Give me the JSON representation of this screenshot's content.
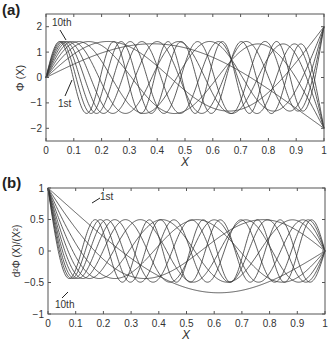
{
  "chart_data": [
    {
      "panel": "(a)",
      "type": "line",
      "title": "",
      "xlabel": "X",
      "ylabel": "Φ (X)",
      "xlim": [
        0,
        1
      ],
      "ylim": [
        -2.5,
        2.5
      ],
      "xticks": [
        "0",
        "0.1",
        "0.2",
        "0.3",
        "0.4",
        "0.5",
        "0.6",
        "0.7",
        "0.8",
        "0.9",
        "1"
      ],
      "yticks": [
        "-2",
        "-1",
        "0",
        "1",
        "2"
      ],
      "grid": false,
      "series_count": 10,
      "modes": [
        1,
        2,
        3,
        4,
        5,
        6,
        7,
        8,
        9,
        10
      ],
      "annotations": [
        {
          "text": "10th",
          "x": 0.04,
          "y": 2.05
        },
        {
          "text": "1st",
          "x": 0.06,
          "y": -0.9
        }
      ],
      "description": "Mode shapes 1st–10th; all start at 0, interior amplitude ≈ ±1.4, end values ≈ ±2 at X=1"
    },
    {
      "panel": "(b)",
      "type": "line",
      "title": "",
      "xlabel": "X",
      "ylabel": "d²Φ (X)/(X²)",
      "xlim": [
        0,
        1
      ],
      "ylim": [
        -1,
        1
      ],
      "xticks": [
        "0",
        "0.1",
        "0.2",
        "0.3",
        "0.4",
        "0.5",
        "0.6",
        "0.7",
        "0.8",
        "0.9",
        "1"
      ],
      "yticks": [
        "-1",
        "-0.5",
        "0",
        "0.5",
        "1"
      ],
      "grid": false,
      "series_count": 10,
      "modes": [
        1,
        2,
        3,
        4,
        5,
        6,
        7,
        8,
        9,
        10
      ],
      "annotations": [
        {
          "text": "1st",
          "x": 0.18,
          "y": 0.85
        },
        {
          "text": "10th",
          "x": 0.05,
          "y": -0.88
        }
      ],
      "description": "Second-derivative curves 1st–10th; all start at 1 and end at 0, interior oscillation ≈ ±0.7"
    }
  ],
  "labels": {
    "panel_a": "(a)",
    "panel_b": "(b)",
    "a_ann_top": "10th",
    "a_ann_bottom": "1st",
    "b_ann_top": "1st",
    "b_ann_bottom": "10th",
    "a_xlabel": "X",
    "b_xlabel": "X",
    "a_ylabel": "Φ (X)",
    "b_ylabel": "d²Φ (X)/(X²)"
  }
}
